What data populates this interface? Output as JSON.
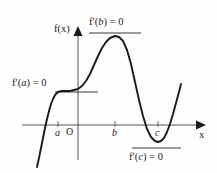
{
  "figure": {
    "kind": "calculus-graph",
    "background_color": "#fdfdfd",
    "stroke_color": "#1a1a1a",
    "axis_color": "#555555"
  },
  "axes": {
    "y_axis_label": "f(x)",
    "x_axis_label": "x",
    "origin_label": "O",
    "x_axis_y_px": 125,
    "y_axis_x_px": 78
  },
  "tick_labels": [
    {
      "name": "a",
      "text": "a",
      "x_px": 58
    },
    {
      "name": "b",
      "text": "b",
      "x_px": 115
    },
    {
      "name": "c",
      "text": "c",
      "x_px": 158
    }
  ],
  "annotations": [
    {
      "name": "f-prime-a",
      "text": "f′(a) = 0",
      "prefix": "f′(",
      "variable": "a",
      "suffix": ") = 0",
      "position": "left",
      "tangent": {
        "x1": 55,
        "x2": 98,
        "y": 92
      }
    },
    {
      "name": "f-prime-b",
      "text": "f′(b) = 0",
      "prefix": "f′(",
      "variable": "b",
      "suffix": ") = 0",
      "position": "top",
      "tangent": {
        "x1": 89,
        "x2": 141,
        "y": 33
      }
    },
    {
      "name": "f-prime-c",
      "text": "f′(c) = 0",
      "prefix": "f′(",
      "variable": "c",
      "suffix": ") = 0",
      "position": "bottom",
      "tangent": {
        "x1": 132,
        "x2": 181,
        "y": 148
      }
    }
  ],
  "chart_data": {
    "type": "line",
    "title": "",
    "xlabel": "x",
    "ylabel": "f(x)",
    "grid": false,
    "legend": null,
    "critical_points": [
      {
        "label": "a",
        "x_px": 58,
        "y_px": 92,
        "type": "stationary-inflection",
        "derivative": 0
      },
      {
        "label": "b",
        "x_px": 115,
        "y_px": 36,
        "type": "local-maximum",
        "derivative": 0
      },
      {
        "label": "c",
        "x_px": 158,
        "y_px": 142,
        "type": "local-minimum",
        "derivative": 0
      }
    ],
    "curve_points_px": [
      [
        37,
        167
      ],
      [
        39,
        158
      ],
      [
        41,
        148
      ],
      [
        43,
        138
      ],
      [
        45,
        128
      ],
      [
        47,
        119
      ],
      [
        49,
        111
      ],
      [
        51,
        104
      ],
      [
        53,
        99
      ],
      [
        55,
        95
      ],
      [
        58,
        92
      ],
      [
        62,
        91
      ],
      [
        66,
        91
      ],
      [
        70,
        91
      ],
      [
        74,
        90
      ],
      [
        78,
        89
      ],
      [
        82,
        86
      ],
      [
        86,
        81
      ],
      [
        90,
        74
      ],
      [
        94,
        65
      ],
      [
        98,
        56
      ],
      [
        102,
        48
      ],
      [
        106,
        42
      ],
      [
        110,
        38
      ],
      [
        115,
        36
      ],
      [
        119,
        37
      ],
      [
        123,
        41
      ],
      [
        127,
        50
      ],
      [
        131,
        64
      ],
      [
        135,
        82
      ],
      [
        139,
        100
      ],
      [
        143,
        116
      ],
      [
        147,
        129
      ],
      [
        151,
        137
      ],
      [
        155,
        141
      ],
      [
        158,
        142
      ],
      [
        161,
        141
      ],
      [
        164,
        138
      ],
      [
        167,
        132
      ],
      [
        170,
        124
      ],
      [
        173,
        114
      ],
      [
        176,
        103
      ],
      [
        179,
        92
      ],
      [
        181,
        84
      ]
    ]
  }
}
